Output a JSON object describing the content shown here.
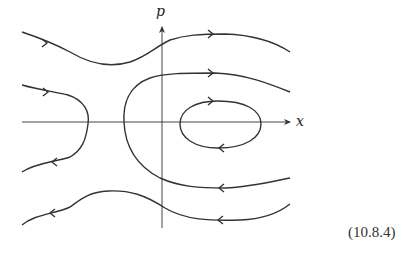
{
  "diagram": {
    "type": "phase-portrait",
    "axes": {
      "horizontal_label": "x",
      "vertical_label": "p",
      "origin": [
        162,
        122
      ]
    },
    "trajectories": [
      {
        "name": "top-open-orbit",
        "direction": "right",
        "path": "M22,32 C40,38 55,44 70,52 C90,64 110,68 130,62 C148,56 155,47 170,40 C185,35 200,34 225,34 C255,35 275,42 290,52"
      },
      {
        "name": "left-reflected-orbit",
        "direction": "down-left",
        "path": "M22,85 C40,90 55,92 68,95 C84,100 90,112 88,124 C86,140 82,150 70,157 C55,162 35,163 22,172"
      },
      {
        "name": "large-c-orbit",
        "direction": "left",
        "path": "M290,92 C270,84 245,74 215,73 C185,73 165,73 150,78 C128,86 123,105 124,122 C125,145 135,165 160,178 C180,187 200,188 225,188 C250,187 270,182 290,178"
      },
      {
        "name": "closed-orbit",
        "direction": "clockwise",
        "path": "M180,124 C180,110 195,101 218,101 C245,101 261,110 261,124 C261,138 245,148 218,148 C195,148 180,138 180,124 Z"
      },
      {
        "name": "bottom-open-orbit",
        "direction": "left",
        "path": "M290,204 C280,212 265,219 240,220 C210,221 185,220 165,208 C145,195 130,190 108,191 C88,192 80,200 70,207 C55,214 35,214 22,225"
      }
    ],
    "arrows": [
      {
        "x": 47,
        "y": 43,
        "dir": "right"
      },
      {
        "x": 213,
        "y": 34,
        "dir": "right"
      },
      {
        "x": 48,
        "y": 92,
        "dir": "right"
      },
      {
        "x": 52,
        "y": 162,
        "dir": "left"
      },
      {
        "x": 213,
        "y": 73,
        "dir": "right"
      },
      {
        "x": 219,
        "y": 188,
        "dir": "left"
      },
      {
        "x": 213,
        "y": 101,
        "dir": "right"
      },
      {
        "x": 219,
        "y": 148,
        "dir": "left"
      },
      {
        "x": 218,
        "y": 220,
        "dir": "left"
      },
      {
        "x": 50,
        "y": 213,
        "dir": "left"
      }
    ],
    "equation_number": "(10.8.4)"
  }
}
